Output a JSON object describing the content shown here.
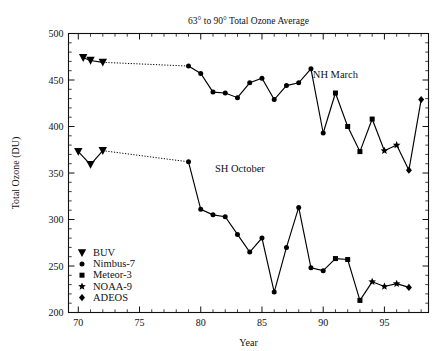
{
  "chart_data": {
    "type": "line",
    "title": "63° to 90° Total Ozone Average",
    "xlabel": "Year",
    "ylabel": "Total Ozone (DU)",
    "xlim": [
      69.2,
      98.6
    ],
    "ylim": [
      200,
      500
    ],
    "x_major_ticks": [
      70,
      75,
      80,
      85,
      90,
      95
    ],
    "x_major_tick_labels": [
      "70",
      "75",
      "80",
      "85",
      "90",
      "95"
    ],
    "x_minor_tick_step": 1,
    "y_major_ticks": [
      200,
      250,
      300,
      350,
      400,
      450,
      500
    ],
    "y_major_tick_labels": [
      "200",
      "250",
      "300",
      "350",
      "400",
      "450",
      "500"
    ],
    "y_minor_tick_step": 10,
    "grid": false,
    "legend_position": "bottom-left",
    "line_color": "#000000",
    "annotations": [
      {
        "text": "NH March",
        "x": 91.0,
        "y": 452
      },
      {
        "text": "SH October",
        "x": 83.2,
        "y": 351
      }
    ],
    "legend": [
      {
        "label": "BUV",
        "marker": "triangle-down"
      },
      {
        "label": "Nimbus-7",
        "marker": "circle"
      },
      {
        "label": "Meteor-3",
        "marker": "square"
      },
      {
        "label": "NOAA-9",
        "marker": "star"
      },
      {
        "label": "ADEOS",
        "marker": "diamond"
      }
    ],
    "series": [
      {
        "name": "NH March",
        "segments": [
          {
            "instrument": "BUV",
            "marker": "triangle-down",
            "linestyle": "solid",
            "points": [
              {
                "x": 70.4,
                "y": 474
              },
              {
                "x": 71.0,
                "y": 471
              },
              {
                "x": 72.0,
                "y": 469
              }
            ]
          },
          {
            "instrument": "gap",
            "marker": "none",
            "linestyle": "dotted",
            "points": [
              {
                "x": 72.0,
                "y": 469
              },
              {
                "x": 79.0,
                "y": 465
              }
            ]
          },
          {
            "instrument": "Nimbus-7",
            "marker": "circle",
            "linestyle": "solid",
            "points": [
              {
                "x": 79.0,
                "y": 465
              },
              {
                "x": 80.0,
                "y": 457
              },
              {
                "x": 81.0,
                "y": 437
              },
              {
                "x": 82.0,
                "y": 436
              },
              {
                "x": 83.0,
                "y": 431
              },
              {
                "x": 84.0,
                "y": 447
              },
              {
                "x": 85.0,
                "y": 452
              },
              {
                "x": 86.0,
                "y": 429
              },
              {
                "x": 87.0,
                "y": 444
              },
              {
                "x": 88.0,
                "y": 447
              },
              {
                "x": 89.0,
                "y": 462
              },
              {
                "x": 90.0,
                "y": 393
              }
            ]
          },
          {
            "instrument": "Meteor-3",
            "marker": "square",
            "linestyle": "solid",
            "points": [
              {
                "x": 91.0,
                "y": 436
              },
              {
                "x": 92.0,
                "y": 400
              },
              {
                "x": 93.0,
                "y": 373
              },
              {
                "x": 94.0,
                "y": 408
              }
            ]
          },
          {
            "instrument": "NOAA-9",
            "marker": "star",
            "linestyle": "solid",
            "points": [
              {
                "x": 95.0,
                "y": 374
              },
              {
                "x": 96.0,
                "y": 380
              }
            ]
          },
          {
            "instrument": "ADEOS",
            "marker": "diamond",
            "linestyle": "solid",
            "points": [
              {
                "x": 97.0,
                "y": 353
              },
              {
                "x": 98.0,
                "y": 429
              }
            ]
          }
        ],
        "connectors": [
          {
            "from": {
              "x": 90.0,
              "y": 393
            },
            "to": {
              "x": 91.0,
              "y": 436
            }
          },
          {
            "from": {
              "x": 94.0,
              "y": 408
            },
            "to": {
              "x": 95.0,
              "y": 374
            }
          },
          {
            "from": {
              "x": 96.0,
              "y": 380
            },
            "to": {
              "x": 97.0,
              "y": 353
            }
          }
        ]
      },
      {
        "name": "SH October",
        "segments": [
          {
            "instrument": "BUV",
            "marker": "triangle-down",
            "linestyle": "solid",
            "points": [
              {
                "x": 70.0,
                "y": 373
              },
              {
                "x": 71.0,
                "y": 359
              },
              {
                "x": 72.0,
                "y": 374
              }
            ]
          },
          {
            "instrument": "gap",
            "marker": "none",
            "linestyle": "dotted",
            "points": [
              {
                "x": 72.0,
                "y": 374
              },
              {
                "x": 79.0,
                "y": 362
              }
            ]
          },
          {
            "instrument": "Nimbus-7",
            "marker": "circle",
            "linestyle": "solid",
            "points": [
              {
                "x": 79.0,
                "y": 362
              },
              {
                "x": 80.0,
                "y": 311
              },
              {
                "x": 81.0,
                "y": 305
              },
              {
                "x": 82.0,
                "y": 303
              },
              {
                "x": 83.0,
                "y": 284
              },
              {
                "x": 84.0,
                "y": 265
              },
              {
                "x": 85.0,
                "y": 280
              },
              {
                "x": 86.0,
                "y": 222
              },
              {
                "x": 87.0,
                "y": 270
              },
              {
                "x": 88.0,
                "y": 313
              },
              {
                "x": 89.0,
                "y": 248
              },
              {
                "x": 90.0,
                "y": 245
              }
            ]
          },
          {
            "instrument": "Meteor-3",
            "marker": "square",
            "linestyle": "solid",
            "points": [
              {
                "x": 91.0,
                "y": 258
              },
              {
                "x": 92.0,
                "y": 257
              },
              {
                "x": 93.0,
                "y": 213
              }
            ]
          },
          {
            "instrument": "NOAA-9",
            "marker": "star",
            "linestyle": "solid",
            "points": [
              {
                "x": 94.0,
                "y": 233
              },
              {
                "x": 95.0,
                "y": 228
              },
              {
                "x": 96.0,
                "y": 231
              }
            ]
          },
          {
            "instrument": "ADEOS",
            "marker": "diamond",
            "linestyle": "solid",
            "points": [
              {
                "x": 97.0,
                "y": 227
              }
            ]
          }
        ],
        "connectors": [
          {
            "from": {
              "x": 90.0,
              "y": 245
            },
            "to": {
              "x": 91.0,
              "y": 258
            }
          },
          {
            "from": {
              "x": 93.0,
              "y": 213
            },
            "to": {
              "x": 94.0,
              "y": 233
            }
          },
          {
            "from": {
              "x": 96.0,
              "y": 231
            },
            "to": {
              "x": 97.0,
              "y": 227
            }
          }
        ]
      }
    ]
  }
}
